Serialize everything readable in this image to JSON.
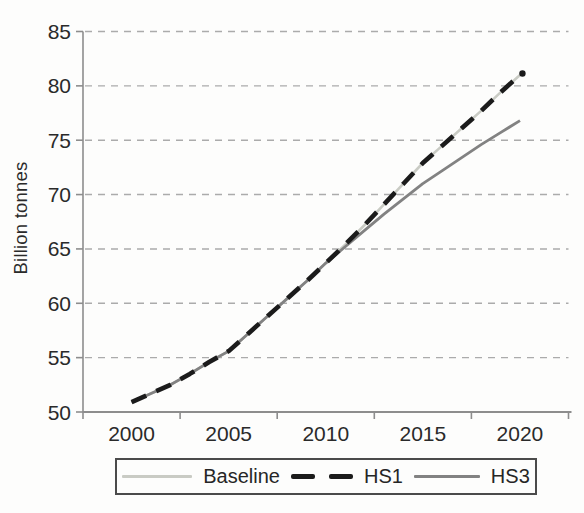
{
  "chart_data": {
    "type": "line",
    "title": "",
    "xlabel": "",
    "ylabel": "Billion tonnes",
    "x": [
      2000,
      2001,
      2002,
      2003,
      2004,
      2005,
      2006,
      2007,
      2008,
      2009,
      2010,
      2011,
      2012,
      2013,
      2014,
      2015,
      2016,
      2017,
      2018,
      2019,
      2020
    ],
    "xticks": [
      2000,
      2005,
      2010,
      2015,
      2020
    ],
    "yticks": [
      50,
      55,
      60,
      65,
      70,
      75,
      80,
      85
    ],
    "ylim": [
      50,
      85
    ],
    "grid": "horizontal-dashed",
    "legend_position": "bottom",
    "axis_color": "#8d8d8d",
    "grid_color": "#ababab",
    "text_color": "#2a2a2a",
    "series": [
      {
        "name": "Baseline",
        "color": "#c9cbc4",
        "style": "solid",
        "line_width": 2.6,
        "z": 0,
        "end_marker": false,
        "values": [
          50.9,
          51.7,
          52.5,
          53.5,
          54.6,
          55.6,
          57.2,
          58.8,
          60.4,
          62.0,
          63.7,
          65.4,
          67.2,
          69.1,
          71.0,
          72.9,
          74.5,
          76.1,
          77.7,
          79.4,
          81.0
        ]
      },
      {
        "name": "HS1",
        "color": "#1b1b1b",
        "style": "dashed",
        "line_width": 4.6,
        "z": 2,
        "end_marker": true,
        "values": [
          50.9,
          51.7,
          52.5,
          53.5,
          54.6,
          55.6,
          57.2,
          58.8,
          60.4,
          62.0,
          63.7,
          65.4,
          67.2,
          69.1,
          71.0,
          72.9,
          74.5,
          76.1,
          77.7,
          79.4,
          81.0
        ]
      },
      {
        "name": "HS3",
        "color": "#828282",
        "style": "solid",
        "line_width": 2.8,
        "z": 1,
        "end_marker": false,
        "values": [
          50.9,
          51.7,
          52.5,
          53.5,
          54.6,
          55.6,
          57.2,
          58.8,
          60.4,
          62.0,
          63.7,
          65.2,
          66.7,
          68.2,
          69.6,
          71.0,
          72.2,
          73.4,
          74.6,
          75.7,
          76.8
        ]
      }
    ]
  }
}
